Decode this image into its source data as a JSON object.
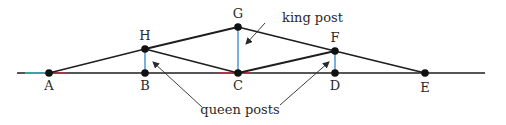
{
  "diagram": {
    "type": "queen post truss",
    "colors": {
      "member": "#1e1e1e",
      "post": "#5b9bd5",
      "node": "#111111",
      "accent_red": "#c0304a",
      "accent_green": "#2e8b57",
      "accent_cyan": "#3cb4b4"
    },
    "baseline": {
      "x1": 17,
      "x2": 485,
      "y": 73
    },
    "nodes": [
      {
        "id": "A",
        "label": "A",
        "x": 49,
        "y": 73,
        "lx": 49,
        "ly": 90
      },
      {
        "id": "B",
        "label": "B",
        "x": 145,
        "y": 73,
        "lx": 145,
        "ly": 90
      },
      {
        "id": "C",
        "label": "C",
        "x": 238,
        "y": 73,
        "lx": 238,
        "ly": 90
      },
      {
        "id": "D",
        "label": "D",
        "x": 335,
        "y": 73,
        "lx": 335,
        "ly": 90
      },
      {
        "id": "E",
        "label": "E",
        "x": 425,
        "y": 73,
        "lx": 425,
        "ly": 92
      },
      {
        "id": "H",
        "label": "H",
        "x": 145,
        "y": 49,
        "lx": 145,
        "ly": 40
      },
      {
        "id": "G",
        "label": "G",
        "x": 238,
        "y": 27,
        "lx": 238,
        "ly": 18
      },
      {
        "id": "F",
        "label": "F",
        "x": 335,
        "y": 51,
        "lx": 335,
        "ly": 42
      }
    ],
    "members": [
      [
        "A",
        "H"
      ],
      [
        "H",
        "G"
      ],
      [
        "G",
        "F"
      ],
      [
        "F",
        "E"
      ],
      [
        "H",
        "C"
      ],
      [
        "C",
        "F"
      ]
    ],
    "posts": [
      [
        "H",
        "B"
      ],
      [
        "G",
        "C"
      ],
      [
        "F",
        "D"
      ]
    ],
    "annotations": {
      "king_post": {
        "text": "king post",
        "x": 282,
        "y": 22,
        "arrow": {
          "x1": 265,
          "y1": 23,
          "x2": 246,
          "y2": 44
        }
      },
      "queen_posts": {
        "text": "queen posts",
        "x": 240,
        "y": 114,
        "arrows": [
          {
            "x1": 202,
            "y1": 107,
            "x2": 153,
            "y2": 62
          },
          {
            "x1": 280,
            "y1": 105,
            "x2": 329,
            "y2": 62
          }
        ]
      }
    }
  }
}
